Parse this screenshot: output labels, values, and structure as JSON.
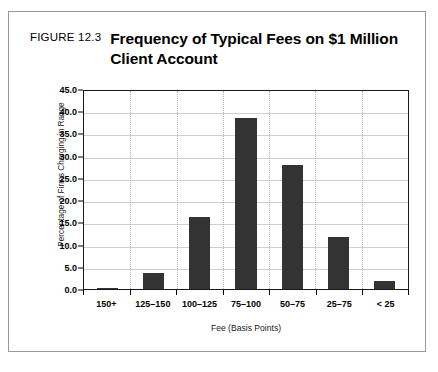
{
  "figure": {
    "number_label": "FIGURE 12.3",
    "title": "Frequency of Typical Fees on $1 Million Client Account"
  },
  "chart_data": {
    "type": "bar",
    "title": "Frequency of Typical Fees on $1 Million Client Account",
    "categories": [
      "150+",
      "125–150",
      "100–125",
      "75–100",
      "50–75",
      "25–75",
      "< 25"
    ],
    "values": [
      0.3,
      3.5,
      16.2,
      38.5,
      27.8,
      11.8,
      1.9
    ],
    "xlabel": "Fee (Basis Points)",
    "ylabel": "Percentage of Firms Charging in Range",
    "ylim": [
      0.0,
      45.0
    ],
    "ytick_labels": [
      "45.0",
      "40.0",
      "35.0",
      "30.0",
      "25.0",
      "20.0",
      "15.0",
      "10.0",
      "5.0",
      "0.0"
    ],
    "ytick_values": [
      45.0,
      40.0,
      35.0,
      30.0,
      25.0,
      20.0,
      15.0,
      10.0,
      5.0,
      0.0
    ],
    "ytick_step": 5.0,
    "grid": "horizontal",
    "legend": "none",
    "bar_color": "#333333",
    "gridline_color": "#cfcfcf",
    "plot_border_color": "#1a1a1a",
    "figure_border_color": "#9a9a9a",
    "background_color": "#ffffff"
  }
}
